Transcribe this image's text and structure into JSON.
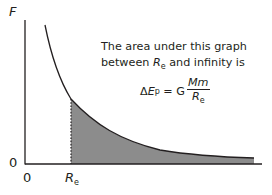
{
  "diagram": {
    "type": "force-distance graph",
    "y_axis_label": "F",
    "y_origin_label": "0",
    "x_origin_label": "0",
    "x_marker_label": "R",
    "x_marker_subscript": "e",
    "annotation": {
      "line1": "The area under this graph",
      "line2_prefix": "between ",
      "line2_var": "R",
      "line2_sub": "e",
      "line2_suffix": " and infinity is",
      "formula_lhs_delta": "Δ",
      "formula_lhs_var": "E",
      "formula_lhs_sub": "p",
      "formula_eq": " = G",
      "formula_numerator": "Mm",
      "formula_denominator_var": "R",
      "formula_denominator_sub": "e"
    },
    "colors": {
      "line": "#231f20",
      "shaded_area": "#8c8c8c"
    }
  }
}
